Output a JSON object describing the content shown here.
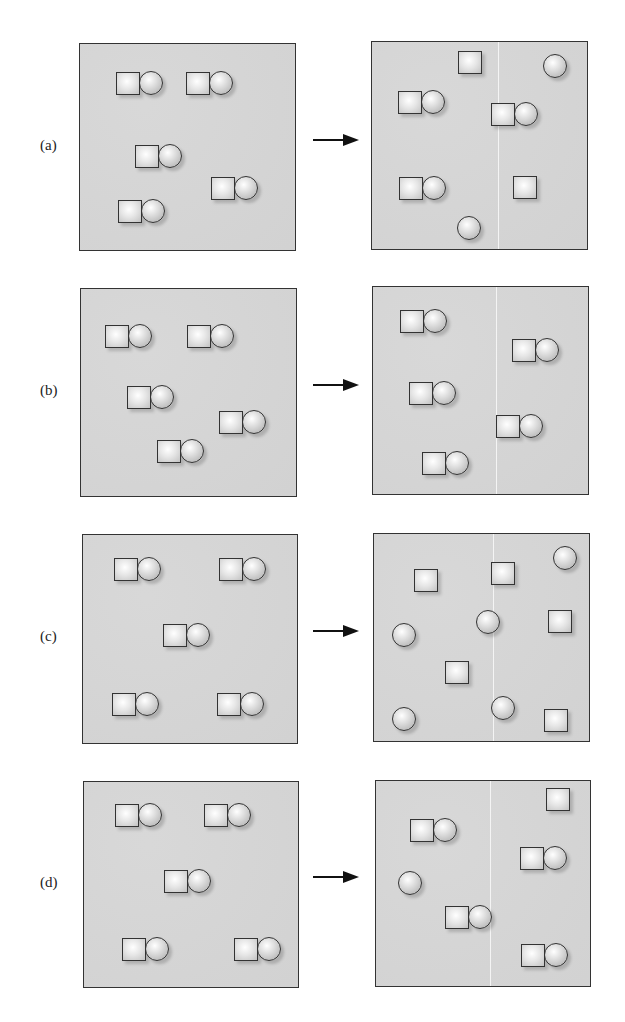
{
  "figure": {
    "arrow_glyph": "right-arrow",
    "colors": {
      "panel_fill": "#d6d6d6",
      "border": "#333333",
      "divider": "#f4f4f4"
    },
    "rows": [
      {
        "label": "(a)",
        "before": {
          "pairs": [
            [
              116,
              72
            ],
            [
              186,
              72
            ],
            [
              135,
              145
            ],
            [
              211,
              177
            ],
            [
              118,
              200
            ]
          ],
          "squares": [],
          "circles": []
        },
        "after": {
          "pairs": [
            [
              398,
              91
            ],
            [
              491,
              103
            ],
            [
              399,
              177
            ]
          ],
          "squares": [
            [
              458,
              51
            ],
            [
              513,
              176
            ]
          ],
          "circles": [
            [
              543,
              54
            ],
            [
              457,
              216
            ]
          ]
        }
      },
      {
        "label": "(b)",
        "before": {
          "pairs": [
            [
              105,
              325
            ],
            [
              187,
              325
            ],
            [
              127,
              386
            ],
            [
              219,
              411
            ],
            [
              157,
              440
            ]
          ],
          "squares": [],
          "circles": []
        },
        "after": {
          "pairs": [
            [
              400,
              310
            ],
            [
              512,
              339
            ],
            [
              409,
              382
            ],
            [
              496,
              415
            ]
          ],
          "squares": [],
          "circles": [],
          "extra_pairs": [
            [
              422,
              452
            ]
          ]
        }
      },
      {
        "label": "(c)",
        "before": {
          "pairs": [
            [
              114,
              558
            ],
            [
              219,
              558
            ],
            [
              163,
              624
            ],
            [
              112,
              693
            ],
            [
              217,
              693
            ]
          ],
          "squares": [],
          "circles": []
        },
        "after": {
          "pairs": [],
          "squares": [
            [
              414,
              569
            ],
            [
              491,
              562
            ],
            [
              548,
              610
            ],
            [
              445,
              661
            ],
            [
              544,
              709
            ]
          ],
          "circles": [
            [
              392,
              623
            ],
            [
              476,
              610
            ],
            [
              553,
              546
            ],
            [
              392,
              707
            ],
            [
              491,
              696
            ]
          ]
        }
      },
      {
        "label": "(d)",
        "before": {
          "pairs": [
            [
              115,
              804
            ],
            [
              204,
              804
            ],
            [
              164,
              870
            ],
            [
              122,
              938
            ],
            [
              234,
              938
            ]
          ],
          "squares": [],
          "circles": []
        },
        "after": {
          "pairs": [
            [
              410,
              819
            ],
            [
              520,
              847
            ],
            [
              445,
              906
            ],
            [
              521,
              944
            ]
          ],
          "squares": [
            [
              546,
              788
            ]
          ],
          "circles": [
            [
              398,
              871
            ]
          ]
        }
      }
    ]
  }
}
